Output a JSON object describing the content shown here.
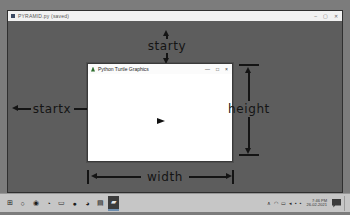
{
  "app_window": {
    "title": "PYRAMID.py (saved)",
    "controls": {
      "minimize": "–",
      "maximize": "▢",
      "close": "✕"
    }
  },
  "turtle_window": {
    "title": "Python Turtle Graphics",
    "controls": {
      "minimize": "—",
      "maximize": "□",
      "close": "×"
    }
  },
  "annotations": {
    "starty_label": "starty",
    "startx_label": "startx",
    "width_label": "width",
    "height_label": "height"
  },
  "taskbar": {
    "icons": [
      {
        "name": "start-button",
        "glyph": "⊞"
      },
      {
        "name": "search-icon",
        "glyph": "○"
      },
      {
        "name": "cortana-icon",
        "glyph": "◉"
      },
      {
        "name": "edge-browser-icon",
        "glyph": "◔"
      },
      {
        "name": "task-view-icon",
        "glyph": "▭"
      },
      {
        "name": "chrome-browser-icon",
        "glyph": "●"
      },
      {
        "name": "firefox-browser-icon",
        "glyph": "◕"
      },
      {
        "name": "file-explorer-icon",
        "glyph": "▤"
      },
      {
        "name": "python-turtle-app-icon",
        "glyph": "▰"
      }
    ],
    "tray_icons": [
      {
        "name": "hidden-icons-chevron",
        "glyph": "∧"
      },
      {
        "name": "onedrive-icon",
        "glyph": "◠"
      },
      {
        "name": "battery-icon",
        "glyph": "▭"
      },
      {
        "name": "network-icon",
        "glyph": "◂"
      },
      {
        "name": "volume-icon",
        "glyph": "▪"
      },
      {
        "name": "language-icon",
        "glyph": "▪"
      }
    ],
    "clock": {
      "time": "7:46 PM",
      "date": "26-02-2021"
    }
  },
  "colors": {
    "desktop_gray": "#5d5d5d",
    "taskbar_gray": "#c6c6c6",
    "annotation_black": "#141414",
    "canvas_white": "#ffffff"
  }
}
